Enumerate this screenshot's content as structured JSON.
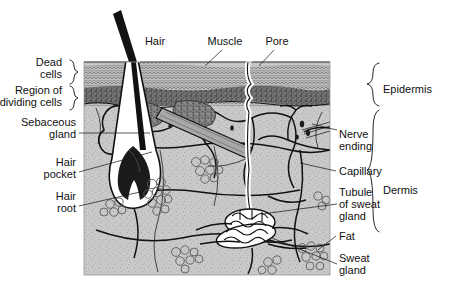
{
  "figure": {
    "type": "anatomical-diagram"
  },
  "colors": {
    "ink": "#111111",
    "dermis_fill": "#c9c9c9",
    "epidermis_dead": "#b4b4b4",
    "epidermis_dividing": "#6e6e6e",
    "hair_shaft": "#121212",
    "white_duct": "#ffffff",
    "paper": "#ffffff"
  },
  "labels": {
    "top": [
      {
        "id": "hair",
        "text": "Hair"
      },
      {
        "id": "muscle",
        "text": "Muscle"
      },
      {
        "id": "pore",
        "text": "Pore"
      }
    ],
    "left": [
      {
        "id": "dead-cells",
        "line1": "Dead",
        "line2": "cells"
      },
      {
        "id": "region-dividing-cells",
        "line1": "Region of",
        "line2": "dividing cells"
      },
      {
        "id": "sebaceous-gland",
        "line1": "Sebaceous",
        "line2": "gland"
      },
      {
        "id": "hair-pocket",
        "line1": "Hair",
        "line2": "pocket"
      },
      {
        "id": "hair-root",
        "line1": "Hair",
        "line2": "root"
      }
    ],
    "right": [
      {
        "id": "nerve-ending",
        "line1": "Nerve",
        "line2": "ending",
        "line3": ""
      },
      {
        "id": "capillary",
        "line1": "Capillary",
        "line2": "",
        "line3": ""
      },
      {
        "id": "tubule-of-sweat-gland",
        "line1": "Tubule",
        "line2": "of sweat",
        "line3": "gland"
      },
      {
        "id": "fat",
        "line1": "Fat",
        "line2": "",
        "line3": ""
      },
      {
        "id": "sweat-gland",
        "line1": "Sweat",
        "line2": "gland",
        "line3": ""
      }
    ],
    "brackets": [
      {
        "id": "epidermis",
        "text": "Epidermis"
      },
      {
        "id": "dermis",
        "text": "Dermis"
      }
    ]
  }
}
